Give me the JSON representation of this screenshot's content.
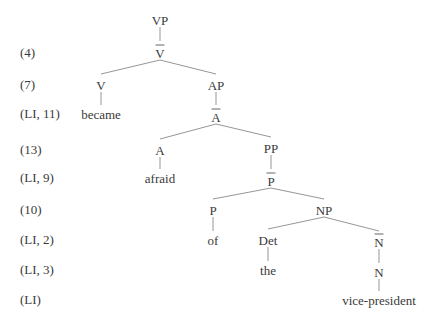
{
  "diagram": {
    "type": "syntax-tree",
    "row_labels": [
      "(4)",
      "(7)",
      "(LI, 11)",
      "(13)",
      "(LI, 9)",
      "(10)",
      "(LI, 2)",
      "(LI, 3)",
      "(LI)"
    ],
    "nodes": [
      {
        "id": "vp",
        "text": "VP",
        "bar": false
      },
      {
        "id": "vbar",
        "text": "V",
        "bar": true
      },
      {
        "id": "v",
        "text": "V",
        "bar": false
      },
      {
        "id": "became",
        "text": "became",
        "bar": false
      },
      {
        "id": "ap",
        "text": "AP",
        "bar": false
      },
      {
        "id": "abar",
        "text": "A",
        "bar": true
      },
      {
        "id": "a",
        "text": "A",
        "bar": false
      },
      {
        "id": "afraid",
        "text": "afraid",
        "bar": false
      },
      {
        "id": "pp",
        "text": "PP",
        "bar": false
      },
      {
        "id": "pbar",
        "text": "P",
        "bar": true
      },
      {
        "id": "p",
        "text": "P",
        "bar": false
      },
      {
        "id": "of",
        "text": "of",
        "bar": false
      },
      {
        "id": "np",
        "text": "NP",
        "bar": false
      },
      {
        "id": "det",
        "text": "Det",
        "bar": false
      },
      {
        "id": "the",
        "text": "the",
        "bar": false
      },
      {
        "id": "nbar",
        "text": "N",
        "bar": true
      },
      {
        "id": "n",
        "text": "N",
        "bar": false
      },
      {
        "id": "vicepresident",
        "text": "vice-president",
        "bar": false
      }
    ],
    "edges": [
      [
        "vp",
        "vbar"
      ],
      [
        "vbar",
        "v"
      ],
      [
        "vbar",
        "ap"
      ],
      [
        "v",
        "became"
      ],
      [
        "ap",
        "abar"
      ],
      [
        "abar",
        "a"
      ],
      [
        "abar",
        "pp"
      ],
      [
        "a",
        "afraid"
      ],
      [
        "pp",
        "pbar"
      ],
      [
        "pbar",
        "p"
      ],
      [
        "pbar",
        "np"
      ],
      [
        "p",
        "of"
      ],
      [
        "np",
        "det"
      ],
      [
        "np",
        "nbar"
      ],
      [
        "det",
        "the"
      ],
      [
        "nbar",
        "n"
      ],
      [
        "n",
        "vicepresident"
      ]
    ]
  }
}
